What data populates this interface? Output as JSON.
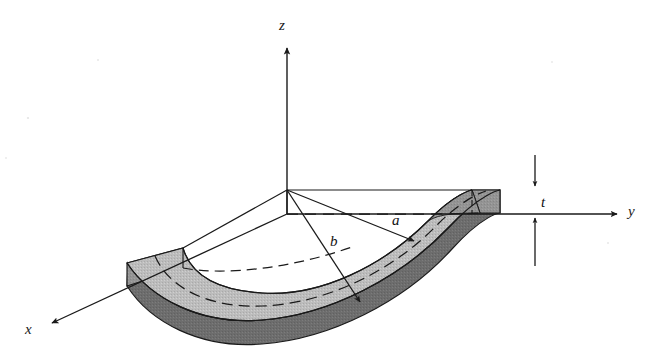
{
  "figure": {
    "type": "engineering-3d-sketch",
    "projection": "isometric",
    "colors": {
      "top_face": "#b9b9b9",
      "inner_side_face": "#9a9a9a",
      "outer_side_face": "#6d6d6d",
      "end_face": "#8f8f8f",
      "outline": "#1a1a1a",
      "background": "#ffffff"
    },
    "axes": [
      {
        "name": "z",
        "label": "z",
        "direction": "up",
        "origin": [
          287,
          214
        ],
        "tip": [
          287,
          44
        ]
      },
      {
        "name": "y",
        "label": "y",
        "direction": "right",
        "origin": [
          287,
          214
        ],
        "tip": [
          621,
          214
        ]
      },
      {
        "name": "x",
        "label": "x",
        "direction": "down-left",
        "origin": [
          287,
          214
        ],
        "tip": [
          48,
          325
        ]
      }
    ],
    "dimensions": [
      {
        "name": "a",
        "label": "a",
        "meaning": "inner radius",
        "from": [
          287,
          190
        ],
        "to": [
          414,
          241
        ]
      },
      {
        "name": "b",
        "label": "b",
        "meaning": "outer radius",
        "from": [
          287,
          190
        ],
        "to": [
          360,
          302
        ]
      },
      {
        "name": "t",
        "label": "t",
        "meaning": "plate thickness",
        "from": [
          535,
          190
        ],
        "to": [
          535,
          214
        ]
      }
    ],
    "geometry": {
      "sector_angle_deg": 90,
      "inner_radius_label": "a",
      "outer_radius_label": "b",
      "thickness_label": "t",
      "mid_surface_dashed": true,
      "hidden_edges_dashed": true
    }
  }
}
